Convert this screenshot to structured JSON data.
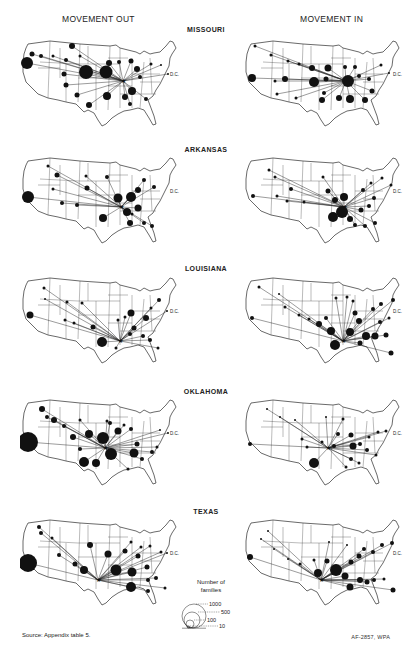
{
  "headers": {
    "left": "MOVEMENT OUT",
    "right": "MOVEMENT IN"
  },
  "states": [
    {
      "name": "MISSOURI",
      "out": [
        [
          52,
          8,
          3
        ],
        [
          7,
          25,
          6
        ],
        [
          12,
          16,
          2.5
        ],
        [
          21,
          18,
          2
        ],
        [
          33,
          18,
          1.5
        ],
        [
          46,
          22,
          2
        ],
        [
          44,
          36,
          2.5
        ],
        [
          60,
          18,
          1.5
        ],
        [
          66,
          34,
          7
        ],
        [
          86,
          34,
          6.5
        ],
        [
          89,
          25,
          3
        ],
        [
          99,
          24,
          2
        ],
        [
          111,
          23,
          2.5
        ],
        [
          117,
          31,
          3
        ],
        [
          120,
          39,
          2
        ],
        [
          112,
          53,
          4
        ],
        [
          87,
          58,
          4
        ],
        [
          105,
          59,
          3
        ],
        [
          110,
          66,
          2
        ],
        [
          126,
          61,
          2
        ],
        [
          131,
          26,
          1.5
        ],
        [
          141,
          27,
          1
        ],
        [
          148,
          36,
          1
        ],
        [
          46,
          47,
          2.5
        ],
        [
          57,
          57,
          2.5
        ],
        [
          69,
          67,
          3
        ]
      ],
      "in": [
        [
          9,
          40,
          4
        ],
        [
          42,
          41,
          3
        ],
        [
          12,
          8,
          1.5
        ],
        [
          28,
          17,
          1.5
        ],
        [
          45,
          23,
          1.5
        ],
        [
          56,
          26,
          1.5
        ],
        [
          69,
          30,
          3
        ],
        [
          85,
          30,
          3.5
        ],
        [
          83,
          41,
          2.5
        ],
        [
          71,
          44,
          5
        ],
        [
          105,
          43,
          6
        ],
        [
          102,
          29,
          2
        ],
        [
          112,
          29,
          2
        ],
        [
          116,
          38,
          2
        ],
        [
          126,
          41,
          2
        ],
        [
          129,
          53,
          2.5
        ],
        [
          107,
          61,
          4
        ],
        [
          122,
          62,
          3
        ],
        [
          96,
          60,
          3
        ],
        [
          79,
          62,
          3
        ],
        [
          81,
          55,
          2
        ],
        [
          138,
          27,
          1.5
        ],
        [
          146,
          35,
          1
        ],
        [
          53,
          60,
          1.5
        ],
        [
          34,
          56,
          1.5
        ],
        [
          32,
          43,
          1.5
        ]
      ]
    },
    {
      "name": "ARKANSAS",
      "out": [
        [
          8,
          42,
          6
        ],
        [
          42,
          48,
          2
        ],
        [
          57,
          50,
          2
        ],
        [
          67,
          33,
          2.5
        ],
        [
          37,
          20,
          2.5
        ],
        [
          28,
          11,
          1.5
        ],
        [
          33,
          34,
          1.5
        ],
        [
          66,
          21,
          1.5
        ],
        [
          87,
          22,
          2
        ],
        [
          98,
          43,
          4.5
        ],
        [
          111,
          42,
          5
        ],
        [
          107,
          57,
          4
        ],
        [
          118,
          53,
          3.5
        ],
        [
          118,
          35,
          3
        ],
        [
          124,
          25,
          2
        ],
        [
          134,
          32,
          2
        ],
        [
          83,
          63,
          4
        ],
        [
          110,
          68,
          3
        ],
        [
          124,
          68,
          2
        ],
        [
          132,
          71,
          2
        ],
        [
          112,
          59,
          1.5
        ]
      ],
      "in": [
        [
          10,
          41,
          2
        ],
        [
          34,
          41,
          1.5
        ],
        [
          44,
          46,
          1.5
        ],
        [
          61,
          47,
          1.5
        ],
        [
          48,
          34,
          2
        ],
        [
          26,
          15,
          1.5
        ],
        [
          32,
          22,
          1.5
        ],
        [
          80,
          22,
          1.5
        ],
        [
          85,
          36,
          2.5
        ],
        [
          92,
          45,
          3
        ],
        [
          101,
          42,
          4
        ],
        [
          99,
          57,
          6
        ],
        [
          90,
          62,
          5
        ],
        [
          107,
          64,
          3
        ],
        [
          118,
          55,
          2.5
        ],
        [
          126,
          51,
          2
        ],
        [
          131,
          43,
          2
        ],
        [
          120,
          35,
          2
        ],
        [
          128,
          28,
          1.5
        ],
        [
          139,
          23,
          1.5
        ],
        [
          112,
          70,
          2
        ],
        [
          122,
          71,
          2
        ],
        [
          132,
          68,
          2
        ],
        [
          148,
          30,
          1.5
        ]
      ]
    },
    {
      "name": "LOUISIANA",
      "out": [
        [
          10,
          40,
          3.5
        ],
        [
          24,
          13,
          1.5
        ],
        [
          25,
          24,
          1
        ],
        [
          47,
          27,
          1.5
        ],
        [
          62,
          28,
          1.5
        ],
        [
          45,
          45,
          1.5
        ],
        [
          54,
          48,
          1.5
        ],
        [
          73,
          52,
          2.5
        ],
        [
          82,
          67,
          5
        ],
        [
          98,
          45,
          1.5
        ],
        [
          105,
          42,
          1.5
        ],
        [
          111,
          38,
          3.5
        ],
        [
          114,
          53,
          2.5
        ],
        [
          126,
          43,
          3
        ],
        [
          131,
          33,
          1.5
        ],
        [
          139,
          25,
          2
        ],
        [
          147,
          36,
          1
        ],
        [
          110,
          59,
          2
        ],
        [
          123,
          61,
          2
        ],
        [
          130,
          65,
          2
        ],
        [
          138,
          73,
          1.5
        ],
        [
          96,
          73,
          1.5
        ]
      ],
      "in": [
        [
          9,
          43,
          2
        ],
        [
          16,
          12,
          1.5
        ],
        [
          36,
          19,
          1
        ],
        [
          42,
          32,
          1.5
        ],
        [
          56,
          40,
          1.5
        ],
        [
          66,
          44,
          1.5
        ],
        [
          76,
          49,
          3
        ],
        [
          88,
          56,
          4
        ],
        [
          83,
          43,
          2
        ],
        [
          93,
          23,
          1.5
        ],
        [
          104,
          22,
          1.5
        ],
        [
          110,
          26,
          1.5
        ],
        [
          112,
          38,
          2.5
        ],
        [
          116,
          46,
          3
        ],
        [
          107,
          57,
          4
        ],
        [
          123,
          61,
          4
        ],
        [
          132,
          61,
          3.5
        ],
        [
          143,
          60,
          2.5
        ],
        [
          117,
          68,
          2.5
        ],
        [
          130,
          34,
          2
        ],
        [
          138,
          29,
          2
        ],
        [
          150,
          25,
          2
        ],
        [
          146,
          43,
          1.5
        ],
        [
          137,
          47,
          2
        ],
        [
          148,
          78,
          2.5
        ],
        [
          92,
          70,
          5
        ]
      ]
    },
    {
      "name": "OKLAHOMA",
      "out": [
        [
          8,
          45,
          10
        ],
        [
          22,
          12,
          3
        ],
        [
          34,
          23,
          3
        ],
        [
          27,
          20,
          2
        ],
        [
          44,
          29,
          2
        ],
        [
          60,
          23,
          1.5
        ],
        [
          53,
          40,
          3
        ],
        [
          69,
          37,
          4
        ],
        [
          83,
          41,
          6
        ],
        [
          87,
          24,
          1.5
        ],
        [
          90,
          26,
          2
        ],
        [
          98,
          34,
          3.5
        ],
        [
          104,
          28,
          1.5
        ],
        [
          111,
          32,
          2
        ],
        [
          117,
          47,
          2.5
        ],
        [
          114,
          56,
          4.5
        ],
        [
          91,
          57,
          6
        ],
        [
          76,
          66,
          4
        ],
        [
          64,
          65,
          5
        ],
        [
          60,
          52,
          2
        ],
        [
          132,
          55,
          2
        ],
        [
          122,
          62,
          2
        ],
        [
          108,
          72,
          1.5
        ],
        [
          137,
          50,
          1.5
        ],
        [
          140,
          33,
          1
        ],
        [
          148,
          36,
          1
        ]
      ],
      "in": [
        [
          7,
          47,
          2
        ],
        [
          24,
          12,
          1
        ],
        [
          37,
          20,
          1
        ],
        [
          52,
          23,
          1
        ],
        [
          59,
          42,
          1.5
        ],
        [
          64,
          50,
          1.5
        ],
        [
          79,
          45,
          1.5
        ],
        [
          91,
          49,
          2
        ],
        [
          95,
          37,
          2
        ],
        [
          108,
          38,
          2.5
        ],
        [
          110,
          49,
          3.5
        ],
        [
          117,
          47,
          2
        ],
        [
          124,
          53,
          2
        ],
        [
          133,
          58,
          1.5
        ],
        [
          126,
          40,
          1.5
        ],
        [
          135,
          35,
          1.5
        ],
        [
          143,
          34,
          1.5
        ],
        [
          108,
          62,
          2
        ],
        [
          116,
          66,
          1.5
        ],
        [
          71,
          66,
          5
        ],
        [
          103,
          70,
          1.5
        ],
        [
          83,
          20,
          1
        ],
        [
          100,
          22,
          1.5
        ]
      ]
    },
    {
      "name": "TEXAS",
      "out": [
        [
          8,
          46,
          9
        ],
        [
          19,
          10,
          2
        ],
        [
          21,
          16,
          2
        ],
        [
          32,
          21,
          1.5
        ],
        [
          39,
          38,
          2
        ],
        [
          55,
          47,
          2.5
        ],
        [
          64,
          53,
          4
        ],
        [
          70,
          28,
          3
        ],
        [
          88,
          37,
          3.5
        ],
        [
          96,
          53,
          5.5
        ],
        [
          105,
          34,
          2.5
        ],
        [
          111,
          25,
          1.5
        ],
        [
          112,
          55,
          4.5
        ],
        [
          118,
          39,
          2.5
        ],
        [
          121,
          30,
          1.5
        ],
        [
          130,
          29,
          1.5
        ],
        [
          127,
          50,
          2.5
        ],
        [
          128,
          63,
          2
        ],
        [
          136,
          61,
          2
        ],
        [
          141,
          35,
          1.5
        ],
        [
          147,
          36,
          1
        ],
        [
          111,
          70,
          5
        ],
        [
          128,
          74,
          2
        ],
        [
          145,
          71,
          1.5
        ]
      ],
      "in": [
        [
          7,
          40,
          3
        ],
        [
          18,
          22,
          1
        ],
        [
          25,
          14,
          1
        ],
        [
          31,
          32,
          1
        ],
        [
          45,
          42,
          1
        ],
        [
          57,
          47,
          1.5
        ],
        [
          71,
          43,
          1.5
        ],
        [
          84,
          44,
          2.5
        ],
        [
          75,
          56,
          4
        ],
        [
          93,
          53,
          6
        ],
        [
          102,
          59,
          3.5
        ],
        [
          108,
          45,
          2.5
        ],
        [
          116,
          39,
          2.5
        ],
        [
          121,
          32,
          2
        ],
        [
          130,
          35,
          2
        ],
        [
          139,
          28,
          2
        ],
        [
          149,
          26,
          2
        ],
        [
          117,
          63,
          3
        ],
        [
          124,
          65,
          2.5
        ],
        [
          131,
          63,
          2
        ],
        [
          141,
          62,
          1.5
        ],
        [
          107,
          70,
          3.5
        ],
        [
          150,
          73,
          2.5
        ],
        [
          86,
          25,
          1
        ],
        [
          104,
          28,
          1
        ]
      ]
    }
  ],
  "legend": {
    "title_line1": "Number of",
    "title_line2": "families",
    "scale": [
      "1000",
      "500",
      "100",
      "10"
    ]
  },
  "footer": {
    "source": "Source: Appendix table 5.",
    "credit": "AF-2857, WPA"
  },
  "labels": {
    "dc": "D.C."
  }
}
